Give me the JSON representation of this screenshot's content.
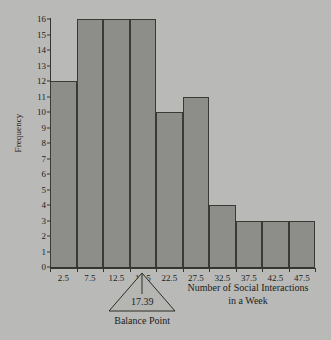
{
  "figure": {
    "background_color": "#b9b9b7",
    "bar_fill_color": "#8d8d89",
    "axis_color": "#35352f",
    "text_color": "#1d1d1b"
  },
  "axes": {
    "y_title": "Frequency",
    "x_title_line1": "Number of Social Interactions",
    "x_title_line2": "in a Week"
  },
  "annotation": {
    "balance_value": "17.39",
    "balance_caption": "Balance Point"
  },
  "chart_data": {
    "type": "bar",
    "title": "",
    "xlabel": "Number of Social Interactions in a Week",
    "ylabel": "Frequency",
    "categories": [
      "2.5",
      "7.5",
      "12.5",
      "17.5",
      "22.5",
      "27.5",
      "32.5",
      "37.5",
      "42.5",
      "47.5"
    ],
    "values": [
      12,
      16,
      16,
      16,
      10,
      11,
      4,
      3,
      3,
      3
    ],
    "bin_edges": [
      0,
      5,
      10,
      15,
      20,
      25,
      30,
      35,
      40,
      45,
      50
    ],
    "bin_width": 5,
    "xlim": [
      0,
      50
    ],
    "ylim": [
      0,
      16
    ],
    "y_ticks": [
      0,
      1,
      2,
      3,
      4,
      5,
      6,
      7,
      8,
      9,
      10,
      11,
      12,
      13,
      14,
      15,
      16
    ],
    "x_ticks": [
      2.5,
      7.5,
      12.5,
      17.5,
      22.5,
      27.5,
      32.5,
      37.5,
      42.5,
      47.5
    ],
    "grid": false,
    "legend": false,
    "annotations": [
      {
        "type": "balance-point-marker",
        "label": "Balance Point",
        "value": 17.39
      }
    ]
  }
}
